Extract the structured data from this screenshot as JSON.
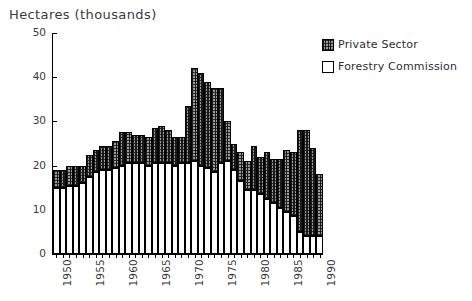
{
  "chart_data": {
    "type": "bar",
    "title": "Hectares (thousands)",
    "subtitle": "",
    "xlabel": "",
    "ylabel": "Hectares (thousands)",
    "stacked": true,
    "grid": false,
    "legend_position": "top-right",
    "ylim": [
      0,
      50
    ],
    "yticks": [
      0,
      10,
      20,
      30,
      40,
      50
    ],
    "ytick_labels": [
      "0",
      "10",
      "20",
      "30",
      "40",
      "50"
    ],
    "xtick_labels": [
      "1950",
      "1955",
      "1960",
      "1965",
      "1970",
      "1975",
      "1980",
      "1985",
      "1990"
    ],
    "xtick_rotation": 90,
    "categories": [
      "1950",
      "1951",
      "1952",
      "1953",
      "1954",
      "1955",
      "1956",
      "1957",
      "1958",
      "1959",
      "1960",
      "1961",
      "1962",
      "1963",
      "1964",
      "1965",
      "1966",
      "1967",
      "1968",
      "1969",
      "1970",
      "1971",
      "1972",
      "1973",
      "1974",
      "1975",
      "1976",
      "1977",
      "1978",
      "1979",
      "1980",
      "1981",
      "1982",
      "1983",
      "1984",
      "1985",
      "1986",
      "1987",
      "1988",
      "1989",
      "1990"
    ],
    "series": [
      {
        "name": "Forestry Commission",
        "color": "#ffffff",
        "pattern": "dotted",
        "values": [
          15.0,
          15.0,
          15.5,
          15.5,
          16.0,
          17.5,
          18.5,
          19.0,
          19.0,
          19.5,
          20.0,
          20.5,
          20.5,
          20.5,
          20.0,
          20.5,
          20.5,
          20.5,
          20.0,
          20.5,
          20.5,
          21.0,
          20.0,
          19.5,
          18.5,
          20.5,
          21.0,
          19.0,
          16.5,
          14.5,
          14.5,
          13.5,
          12.5,
          11.5,
          10.5,
          9.5,
          8.5,
          5.0,
          4.0,
          4.0,
          4.0
        ]
      },
      {
        "name": "Private Sector",
        "color": "#4a4a4a",
        "pattern": "hatched",
        "values": [
          4.0,
          4.0,
          4.5,
          4.5,
          4.0,
          5.0,
          5.0,
          5.5,
          5.5,
          6.0,
          7.5,
          7.0,
          6.5,
          6.5,
          6.5,
          8.0,
          8.5,
          7.5,
          6.5,
          6.0,
          13.0,
          21.0,
          21.0,
          19.5,
          19.0,
          17.0,
          9.0,
          6.0,
          6.5,
          6.5,
          10.0,
          8.5,
          10.5,
          10.0,
          11.0,
          14.0,
          14.5,
          23.0,
          24.0,
          20.0,
          14.0
        ]
      }
    ],
    "totals": [
      19.0,
      19.0,
      20.0,
      20.0,
      20.0,
      22.5,
      23.5,
      24.5,
      24.5,
      25.5,
      27.5,
      27.5,
      27.0,
      27.0,
      26.5,
      28.5,
      29.0,
      28.0,
      26.5,
      26.5,
      33.5,
      42.0,
      41.0,
      39.0,
      37.5,
      37.5,
      30.0,
      25.0,
      23.0,
      21.0,
      24.5,
      22.0,
      23.0,
      21.5,
      21.5,
      23.5,
      23.0,
      28.0,
      28.0,
      24.0,
      18.0
    ]
  },
  "legend": {
    "items": [
      {
        "label": "Private Sector",
        "swatch": "private-sector-swatch"
      },
      {
        "label": "Forestry Commission",
        "swatch": "forestry-commission-swatch"
      }
    ]
  }
}
